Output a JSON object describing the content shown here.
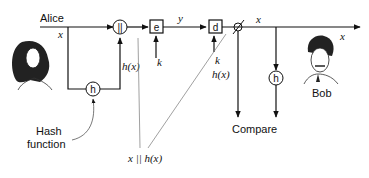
{
  "diagram": {
    "alice_label": "Alice",
    "bob_label": "Bob",
    "hash_function_label_line1": "Hash",
    "hash_function_label_line2": "function",
    "compare_label": "Compare",
    "concat_symbol": "||",
    "encrypt_symbol": "e",
    "decrypt_symbol": "d",
    "hash_symbol": "h",
    "labels": {
      "x_alice": "x",
      "h_x_alice": "h(x)",
      "k_encrypt": "k",
      "y": "y",
      "k_decrypt": "k",
      "h_x_bob": "h(x)",
      "x_bob_top": "x",
      "x_bob_right": "x",
      "concat_annotation": "x || h(x)"
    }
  }
}
